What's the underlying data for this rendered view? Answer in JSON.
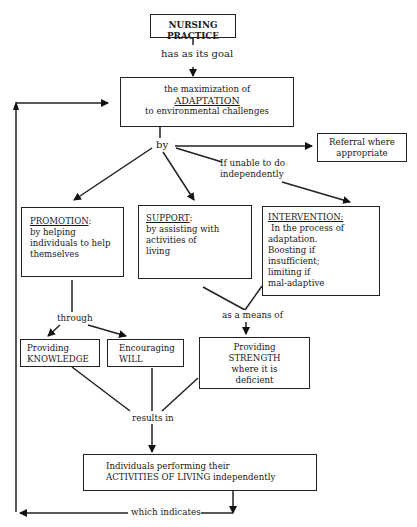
{
  "diagram": {
    "title_box": {
      "label": "NURSING PRACTICE"
    },
    "edge_goal": {
      "label": "has as its goal"
    },
    "goal_box": {
      "lines": [
        "the maximization of",
        "ADAPTATION",
        "to environmental challenges"
      ]
    },
    "edge_by": {
      "label": "by"
    },
    "referral_box": {
      "lines": [
        "Referral where",
        "appropriate"
      ]
    },
    "edge_unable": {
      "lines": [
        "If unable to do",
        "independently"
      ]
    },
    "promotion_box": {
      "heading": "PROMOTION",
      "heading_suffix": ":",
      "lines": [
        "by helping",
        "individuals to help",
        "themselves"
      ]
    },
    "support_box": {
      "heading": "SUPPORT",
      "heading_suffix": ":",
      "lines": [
        "by assisting with",
        "activities of",
        "living"
      ]
    },
    "intervention_box": {
      "heading": "INTERVENTION:",
      "lines": [
        "In the process of",
        "adaptation.",
        "Boosting if",
        "insufficient;",
        "limiting if",
        "mal-adaptive"
      ]
    },
    "edge_through": {
      "label": "through"
    },
    "edge_means": {
      "label": "as a means of"
    },
    "knowledge_box": {
      "lines": [
        "Providing",
        "KNOWLEDGE"
      ]
    },
    "will_box": {
      "lines": [
        "Encouraging",
        "WILL"
      ]
    },
    "strength_box": {
      "lines": [
        "Providing",
        "STRENGTH",
        "where it is",
        "deficient"
      ]
    },
    "edge_results": {
      "label": "results in"
    },
    "outcome_box": {
      "lines": [
        "Individuals performing their",
        "ACTIVITIES OF LIVING independently"
      ]
    },
    "edge_indicates": {
      "label": "which indicates"
    }
  }
}
